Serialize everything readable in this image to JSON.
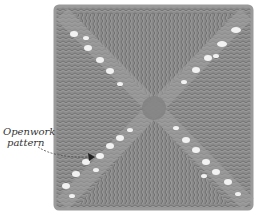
{
  "image": {
    "subject": "Knitted square swatch with diagonal openwork (eyelet) X pattern",
    "background_color": "#ffffff",
    "fabric_color": "#8c8c8c",
    "fabric_dark": "#6e6e6e",
    "eyelet_color": "#f2f2f2"
  },
  "annotation": {
    "line1": "Openwork",
    "line2": "pattern",
    "pointer": "arrow pointing to eyelet hole in lower-left diagonal"
  }
}
